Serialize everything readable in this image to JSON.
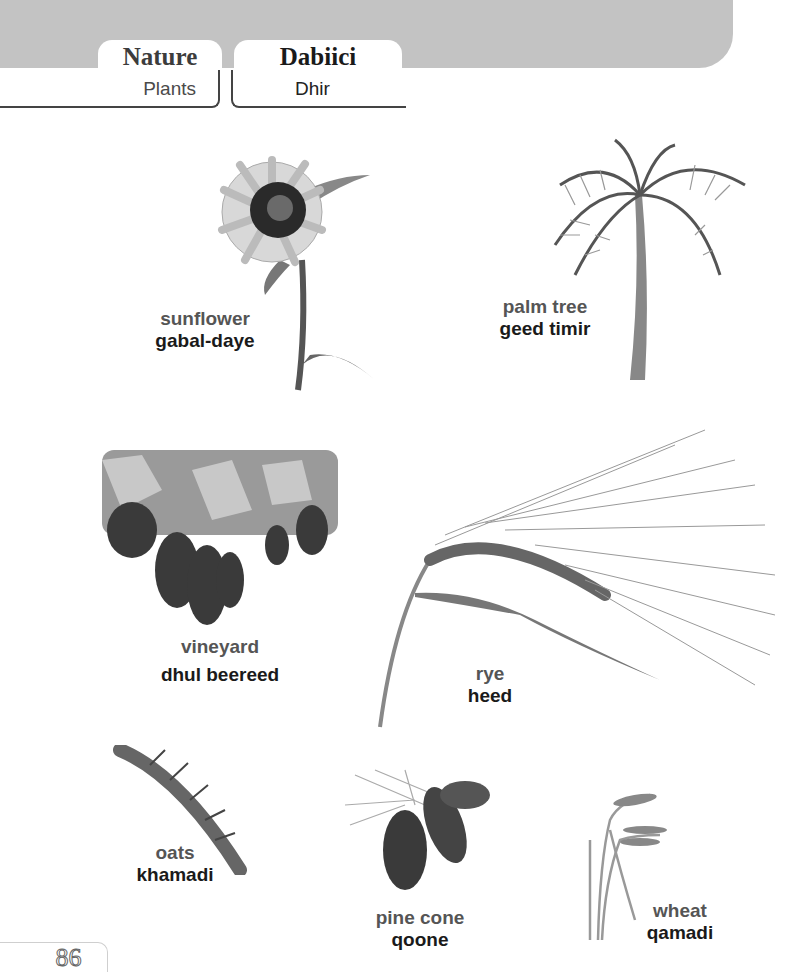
{
  "header": {
    "title_en": "Nature",
    "title_so": "Dabiici",
    "subtitle_en": "Plants",
    "subtitle_so": "Dhir",
    "band_color": "#c3c3c3"
  },
  "items": [
    {
      "en": "sunflower",
      "so": "gabal-daye",
      "icon": "sunflower-image"
    },
    {
      "en": "palm tree",
      "so": "geed timir",
      "icon": "palm-tree-image"
    },
    {
      "en": "vineyard",
      "so": "dhul beereed",
      "icon": "vineyard-image"
    },
    {
      "en": "rye",
      "so": "heed",
      "icon": "rye-image"
    },
    {
      "en": "oats",
      "so": "khamadi",
      "icon": "oats-image"
    },
    {
      "en": "pine cone",
      "so": "qoone",
      "icon": "pine-cone-image"
    },
    {
      "en": "wheat",
      "so": "qamadi",
      "icon": "wheat-image"
    }
  ],
  "footer": {
    "page_number": "86"
  }
}
